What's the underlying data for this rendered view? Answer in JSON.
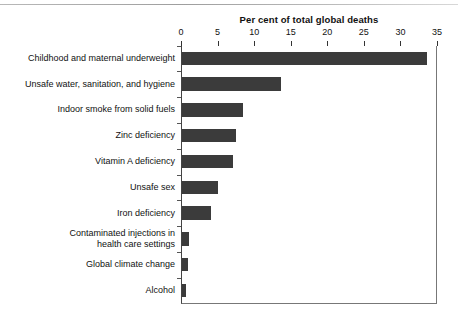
{
  "chart_data": {
    "type": "bar",
    "orientation": "horizontal",
    "title": "Per cent of total global deaths",
    "xlabel": "",
    "ylabel": "",
    "xlim": [
      0,
      35
    ],
    "xticks": [
      0,
      5,
      10,
      15,
      20,
      25,
      30,
      35
    ],
    "grid": false,
    "legend": null,
    "bar_color": "#3b3b3b",
    "categories": [
      "Childhood and maternal underweight",
      "Unsafe water, sanitation, and hygiene",
      "Indoor smoke from solid fuels",
      "Zinc deficiency",
      "Vitamin A deficiency",
      "Unsafe sex",
      "Iron deficiency",
      "Contaminated injections in health care settings",
      "Global climate change",
      "Alcohol"
    ],
    "category_lines": [
      [
        "Childhood and maternal underweight"
      ],
      [
        "Unsafe water, sanitation, and hygiene"
      ],
      [
        "Indoor smoke from solid fuels"
      ],
      [
        "Zinc deficiency"
      ],
      [
        "Vitamin A deficiency"
      ],
      [
        "Unsafe sex"
      ],
      [
        "Iron deficiency"
      ],
      [
        "Contaminated injections in",
        "health care settings"
      ],
      [
        "Global climate change"
      ],
      [
        "Alcohol"
      ]
    ],
    "values": [
      33.5,
      13.6,
      8.3,
      7.4,
      7.0,
      4.9,
      4.0,
      1.0,
      0.8,
      0.6
    ],
    "units": "per cent of total global deaths"
  }
}
